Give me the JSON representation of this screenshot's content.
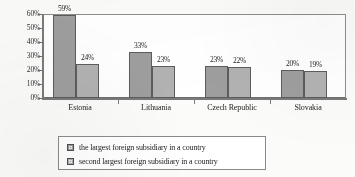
{
  "chart_data": {
    "type": "bar",
    "title": "",
    "xlabel": "",
    "ylabel": "",
    "ylim": [
      0,
      60
    ],
    "ytick_labels": [
      "0%",
      "10%",
      "20%",
      "30%",
      "40%",
      "50%",
      "60%"
    ],
    "ytick_values": [
      0,
      10,
      20,
      30,
      40,
      50,
      60
    ],
    "grid": false,
    "legend_position": "bottom",
    "categories": [
      "Estonia",
      "Lithuania",
      "Czech Republic",
      "Slovakia"
    ],
    "series": [
      {
        "name": "the largest foreign subsidiary in a country",
        "color": "#9e9e9e",
        "values": [
          59,
          33,
          23,
          20
        ],
        "labels": [
          "59%",
          "33%",
          "23%",
          "20%"
        ]
      },
      {
        "name": "second largest foreign subsidiary in a country",
        "color": "#b2b2b2",
        "values": [
          24,
          23,
          22,
          19
        ],
        "labels": [
          "24%",
          "23%",
          "22%",
          "19%"
        ]
      }
    ]
  },
  "legend": {
    "items": [
      {
        "label": "the largest foreign subsidiary in a country"
      },
      {
        "label": "second largest foreign subsidiary in a country"
      }
    ]
  }
}
